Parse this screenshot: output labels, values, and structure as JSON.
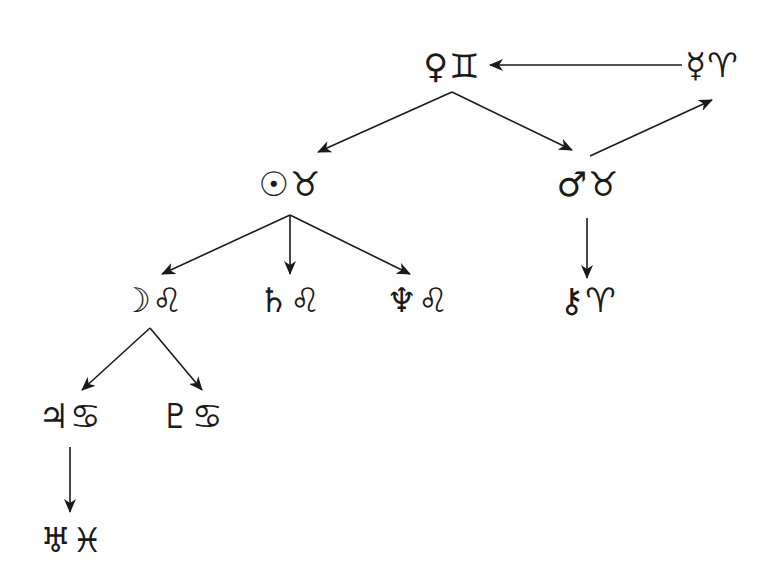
{
  "diagram": {
    "type": "tree",
    "colors": {
      "line": "#1a1a1a",
      "background": "#ffffff"
    },
    "nodes": [
      {
        "id": "venus-gemini",
        "label": "♀♊",
        "x": 452,
        "y": 66
      },
      {
        "id": "mercury-aries",
        "label": "☿♈",
        "x": 712,
        "y": 65
      },
      {
        "id": "sun-taurus",
        "label": "☉♉",
        "x": 290,
        "y": 184
      },
      {
        "id": "mars-taurus",
        "label": "♂♉",
        "x": 588,
        "y": 184
      },
      {
        "id": "moon-leo",
        "label": "☽♌",
        "x": 152,
        "y": 300
      },
      {
        "id": "saturn-leo",
        "label": "♄♌",
        "x": 290,
        "y": 300
      },
      {
        "id": "neptune-leo",
        "label": "♆♌",
        "x": 418,
        "y": 300
      },
      {
        "id": "chiron-aries",
        "label": "⚷♈",
        "x": 588,
        "y": 300
      },
      {
        "id": "jupiter-cancer",
        "label": "♃♋",
        "x": 70,
        "y": 416
      },
      {
        "id": "pluto-cancer",
        "label": "♇♋",
        "x": 192,
        "y": 416
      },
      {
        "id": "uranus-pisces",
        "label": "♅♓",
        "x": 72,
        "y": 540
      }
    ],
    "edges": [
      {
        "from": "mercury-aries",
        "to": "venus-gemini",
        "x1": 682,
        "y1": 65,
        "x2": 490,
        "y2": 65
      },
      {
        "from": "venus-gemini",
        "to": "sun-taurus",
        "x1": 452,
        "y1": 92,
        "x2": 318,
        "y2": 152
      },
      {
        "from": "venus-gemini",
        "to": "mars-taurus",
        "x1": 452,
        "y1": 92,
        "x2": 572,
        "y2": 150
      },
      {
        "from": "mars-taurus",
        "to": "mercury-aries",
        "x1": 590,
        "y1": 156,
        "x2": 712,
        "y2": 100
      },
      {
        "from": "sun-taurus",
        "to": "moon-leo",
        "x1": 290,
        "y1": 215,
        "x2": 162,
        "y2": 274
      },
      {
        "from": "sun-taurus",
        "to": "saturn-leo",
        "x1": 290,
        "y1": 215,
        "x2": 290,
        "y2": 274
      },
      {
        "from": "sun-taurus",
        "to": "neptune-leo",
        "x1": 290,
        "y1": 215,
        "x2": 410,
        "y2": 274
      },
      {
        "from": "mars-taurus",
        "to": "chiron-aries",
        "x1": 587,
        "y1": 218,
        "x2": 587,
        "y2": 278
      },
      {
        "from": "moon-leo",
        "to": "jupiter-cancer",
        "x1": 150,
        "y1": 328,
        "x2": 82,
        "y2": 390
      },
      {
        "from": "moon-leo",
        "to": "pluto-cancer",
        "x1": 150,
        "y1": 328,
        "x2": 202,
        "y2": 390
      },
      {
        "from": "jupiter-cancer",
        "to": "uranus-pisces",
        "x1": 70,
        "y1": 447,
        "x2": 70,
        "y2": 512
      }
    ]
  }
}
